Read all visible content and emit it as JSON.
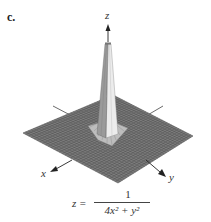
{
  "panel": {
    "label": "c."
  },
  "axes": {
    "x_label": "x",
    "y_label": "y",
    "z_label": "z"
  },
  "formula": {
    "lhs": "z =",
    "numerator": "1",
    "denominator_html": "4x² + y²",
    "full": "z = 1 / (4x^2 + y^2)"
  },
  "colors": {
    "surface": "#7a7a7a",
    "grid": "#4a4a4a",
    "spike_light": "#e8e8e8",
    "spike_dark": "#8c8c8c",
    "axis": "#333333"
  }
}
